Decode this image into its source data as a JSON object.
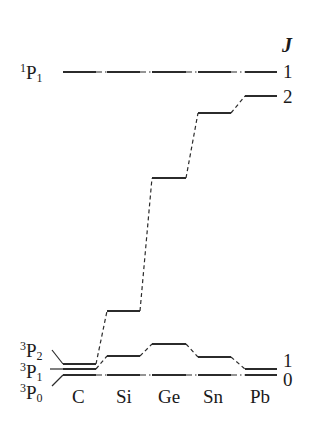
{
  "diagram": {
    "j_header": "J",
    "left_terms": [
      {
        "mult": "1",
        "L": "P",
        "J": "1"
      },
      {
        "mult": "3",
        "L": "P",
        "J": "2"
      },
      {
        "mult": "3",
        "L": "P",
        "J": "1"
      },
      {
        "mult": "3",
        "L": "P",
        "J": "0"
      }
    ],
    "elements": [
      "C",
      "Si",
      "Ge",
      "Sn",
      "Pb"
    ],
    "right_j_labels": {
      "singlet": "1",
      "j2": "2",
      "j1": "1",
      "j0": "0"
    },
    "levels_y": {
      "singlet_P1": [
        72,
        72,
        72,
        72,
        72
      ],
      "triplet_J2": [
        364,
        311,
        178,
        113,
        96
      ],
      "triplet_J1": [
        369,
        356,
        344,
        357,
        369
      ],
      "triplet_J0": [
        375,
        375,
        375,
        375,
        375
      ]
    },
    "column_x": [
      [
        63,
        96
      ],
      [
        107,
        140
      ],
      [
        152,
        186
      ],
      [
        198,
        231
      ],
      [
        245,
        277
      ]
    ],
    "colors": {
      "line": "#2b2b2b",
      "text": "#1a1a1a",
      "background": "#ffffff"
    }
  }
}
